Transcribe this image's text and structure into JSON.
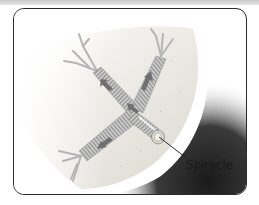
{
  "figure": {
    "labels": [
      {
        "id": "spiracle",
        "text": "Spiracle"
      }
    ],
    "elements": {
      "body_wall": "cuticle-segment",
      "tracheae": "branched tubes with ring reinforcement",
      "arrows": "air flow direction from spiracle into tracheae"
    },
    "colors": {
      "frame_border": "#2a2a2a",
      "body_fill": "#e9e6e1",
      "shadow": "#222222",
      "trachea": "#b8b8b8",
      "arrow": "#6a6a6a"
    }
  }
}
